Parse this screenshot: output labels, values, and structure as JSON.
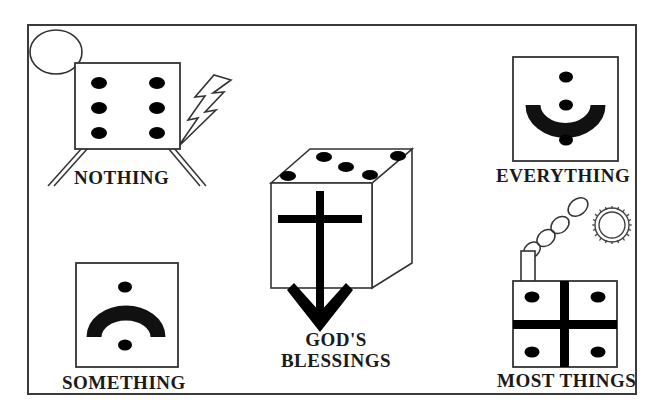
{
  "figure": {
    "border_color": "#3a3a3a",
    "ink_color": "#111111",
    "background": "#ffffff"
  },
  "panels": [
    {
      "id": "nothing",
      "caption": "NOTHING",
      "icon": "dice-face-six-with-legs",
      "pip_count": 6,
      "pip_layout": "two-columns-of-three",
      "extras": [
        "circle-outline",
        "lightning-bolt"
      ]
    },
    {
      "id": "something",
      "caption": "SOMETHING",
      "icon": "domino-arch-with-two-pips",
      "pip_count": 2,
      "pip_layout": "top-and-bottom",
      "extras": []
    },
    {
      "id": "everything",
      "caption": "EVERYTHING",
      "icon": "domino-bowl-with-three-pips",
      "pip_count": 3,
      "pip_layout": "top-center-bottom",
      "extras": []
    },
    {
      "id": "most-things",
      "caption": "MOST THINGS",
      "icon": "dice-face-four-with-cross-and-chimney",
      "pip_count": 4,
      "pip_layout": "four-corners",
      "extras": [
        "chimney-smoke",
        "gear-sun"
      ]
    },
    {
      "id": "gods-blessings",
      "caption_line1": "GOD'S",
      "caption_line2": "BLESSINGS",
      "icon": "cube-with-cross-and-down-arrow",
      "pip_count": 5,
      "pip_layout": "quincunx-on-top-face",
      "extras": [
        "down-arrow"
      ]
    }
  ],
  "icons": {
    "circle": "circle-outline-icon",
    "lightning": "lightning-bolt-icon",
    "gear": "gear-sun-icon",
    "smoke": "smoke-puffs-icon",
    "arrow": "down-arrow-icon",
    "cross": "cross-icon",
    "cube": "cube-icon"
  }
}
